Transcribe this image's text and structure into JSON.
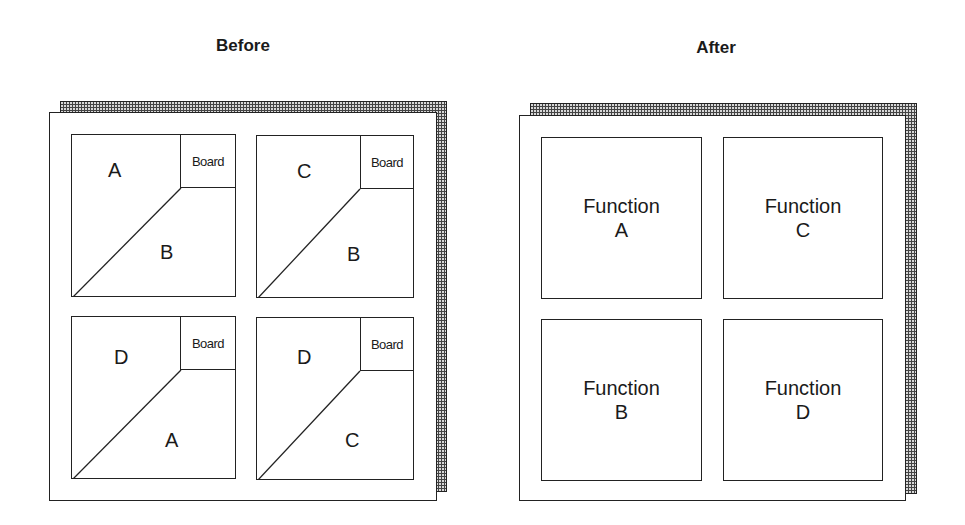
{
  "before": {
    "title": "Before",
    "boards": [
      {
        "board_label": "Board",
        "upper_label": "A",
        "lower_label": "B"
      },
      {
        "board_label": "Board",
        "upper_label": "C",
        "lower_label": "B"
      },
      {
        "board_label": "Board",
        "upper_label": "D",
        "lower_label": "A"
      },
      {
        "board_label": "Board",
        "upper_label": "D",
        "lower_label": "C"
      }
    ]
  },
  "after": {
    "title": "After",
    "boards": [
      {
        "line1": "Function",
        "line2": "A"
      },
      {
        "line1": "Function",
        "line2": "C"
      },
      {
        "line1": "Function",
        "line2": "B"
      },
      {
        "line1": "Function",
        "line2": "D"
      }
    ]
  }
}
